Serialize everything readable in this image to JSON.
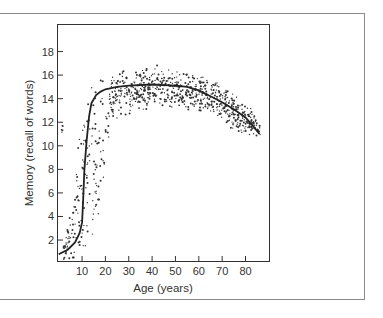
{
  "chart_data": {
    "type": "scatter",
    "title": "",
    "xlabel": "Age (years)",
    "ylabel": "Memory (recall of words)",
    "xlim": [
      0,
      87
    ],
    "ylim": [
      0,
      20
    ],
    "x_ticks": [
      10,
      20,
      30,
      40,
      50,
      60,
      70,
      80
    ],
    "y_ticks": [
      2,
      4,
      6,
      8,
      10,
      12,
      14,
      16,
      18
    ],
    "grid": false,
    "legend": null,
    "series": [
      {
        "name": "trend",
        "kind": "line",
        "x": [
          0,
          4,
          7,
          9,
          10,
          10.5,
          11,
          12,
          13,
          14,
          16,
          18,
          20,
          25,
          30,
          40,
          50,
          55,
          60,
          65,
          70,
          75,
          80,
          84,
          86
        ],
        "y": [
          0.8,
          1.2,
          1.8,
          2.6,
          3.5,
          5.5,
          8.0,
          10.5,
          12.5,
          13.6,
          14.3,
          14.6,
          14.8,
          15.0,
          15.1,
          15.2,
          15.1,
          15.0,
          14.7,
          14.2,
          13.7,
          13.1,
          12.4,
          11.5,
          11.0
        ]
      },
      {
        "name": "individual scores",
        "kind": "scatter",
        "description": "dense cloud of points scattered around the trend line, spread roughly ±2 words; wide vertical spread between ages 5 and 20, band of ~12.5–17 between ages 20 and 60, narrowing toward ~10.5–14 at age 85",
        "band_upper": [
          [
            2,
            1.5
          ],
          [
            6,
            5
          ],
          [
            8,
            10.5
          ],
          [
            10,
            12
          ],
          [
            14,
            15
          ],
          [
            20,
            16
          ],
          [
            30,
            16.8
          ],
          [
            40,
            17
          ],
          [
            50,
            16.6
          ],
          [
            60,
            16.3
          ],
          [
            70,
            15.2
          ],
          [
            80,
            14.2
          ],
          [
            86,
            12
          ]
        ],
        "band_lower": [
          [
            2,
            0.3
          ],
          [
            8,
            0.5
          ],
          [
            12,
            1.5
          ],
          [
            16,
            3
          ],
          [
            20,
            6
          ],
          [
            22,
            12
          ],
          [
            30,
            12.5
          ],
          [
            40,
            13
          ],
          [
            50,
            13
          ],
          [
            60,
            12.8
          ],
          [
            70,
            12
          ],
          [
            80,
            10.5
          ],
          [
            86,
            10.8
          ]
        ]
      }
    ]
  }
}
